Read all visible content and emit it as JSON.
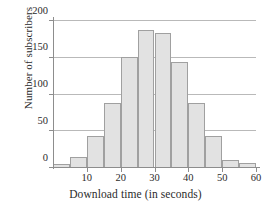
{
  "chart_data": {
    "type": "bar",
    "title": "",
    "xlabel": "Download time (in seconds)",
    "ylabel": "Number of subscribers",
    "categories": [
      "0-5",
      "5-10",
      "10-15",
      "15-20",
      "20-25",
      "25-30",
      "30-35",
      "35-40",
      "40-45",
      "45-50",
      "50-55",
      "55-60"
    ],
    "bin_edges": [
      0,
      5,
      10,
      15,
      20,
      25,
      30,
      35,
      40,
      45,
      50,
      55,
      60
    ],
    "values": [
      6,
      15,
      44,
      89,
      151,
      188,
      184,
      144,
      89,
      44,
      11,
      7
    ],
    "xlim": [
      0,
      60
    ],
    "ylim": [
      0,
      200
    ],
    "xticks": [
      10,
      20,
      30,
      40,
      50,
      60
    ],
    "yticks": [
      0,
      50,
      100,
      150,
      200
    ],
    "xtick_labels": [
      "10",
      "20",
      "30",
      "40",
      "50",
      "60"
    ],
    "ytick_labels": [
      "0",
      "50",
      "100",
      "150",
      "200"
    ],
    "grid": "horizontal",
    "legend": "none",
    "bar_fill_color": "#e2e2e2",
    "bar_edge_color": "#a0a0a0",
    "axis_color": "#8d8d8d",
    "grid_color": "#b9b9b9"
  }
}
